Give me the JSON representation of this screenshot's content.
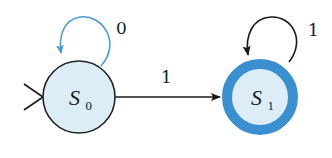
{
  "diagram": {
    "type": "finite-state-automaton",
    "colors": {
      "state_fill": "#dcedf8",
      "state_stroke": "#222222",
      "accept_ring": "#3a8fd0",
      "loop_s0": "#4a9bd6",
      "edge": "#1a1a1a",
      "text": "#1a1a1a"
    },
    "states": [
      {
        "id": "S0",
        "label": "S",
        "subscript": "0",
        "start": true,
        "accepting": false
      },
      {
        "id": "S1",
        "label": "S",
        "subscript": "1",
        "start": false,
        "accepting": true
      }
    ],
    "transitions": [
      {
        "from": "S0",
        "to": "S0",
        "label": "0"
      },
      {
        "from": "S0",
        "to": "S1",
        "label": "1"
      },
      {
        "from": "S1",
        "to": "S1",
        "label": "1"
      }
    ]
  }
}
